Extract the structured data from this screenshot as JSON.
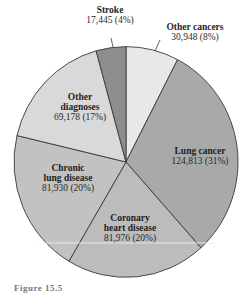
{
  "chart_data": {
    "type": "pie",
    "title": "",
    "center": [
      126,
      162
    ],
    "radius": 112,
    "start_angle_deg": 0,
    "direction": "clockwise",
    "categories": [
      "Other cancers",
      "Lung cancer",
      "Coronary heart disease",
      "Chronic lung disease",
      "Other diagnoses",
      "Stroke"
    ],
    "values": [
      30948,
      124813,
      81976,
      81930,
      69178,
      17445
    ],
    "percents": [
      8,
      31,
      20,
      20,
      17,
      4
    ],
    "value_labels": [
      "30,948 (8%)",
      "124,813 (31%)",
      "81,976 (20%)",
      "81,930 (20%)",
      "69,178 (17%)",
      "17,445 (4%)"
    ],
    "colors": [
      "#e8e8e8",
      "#a9a9a9",
      "#bcbcbc",
      "#c2c2c2",
      "#d9d9d9",
      "#8e8e8e"
    ],
    "legend": "none (direct labels)"
  },
  "labels": {
    "other_cancers": {
      "name": "Other cancers",
      "value": "30,948 (8%)"
    },
    "lung_cancer": {
      "name": "Lung cancer",
      "value": "124,813 (31%)"
    },
    "coronary": {
      "name_line1": "Coronary",
      "name_line2": "heart disease",
      "value": "81,976 (20%)"
    },
    "chronic": {
      "name_line1": "Chronic",
      "name_line2": "lung disease",
      "value": "81,930 (20%)"
    },
    "other_diagnoses": {
      "name_line1": "Other",
      "name_line2": "diagnoses",
      "value": "69,178 (17%)"
    },
    "stroke": {
      "name": "Stroke",
      "value": "17,445 (4%)"
    }
  },
  "caption": {
    "prefix": "Figure 15.5",
    "rest": "..."
  }
}
